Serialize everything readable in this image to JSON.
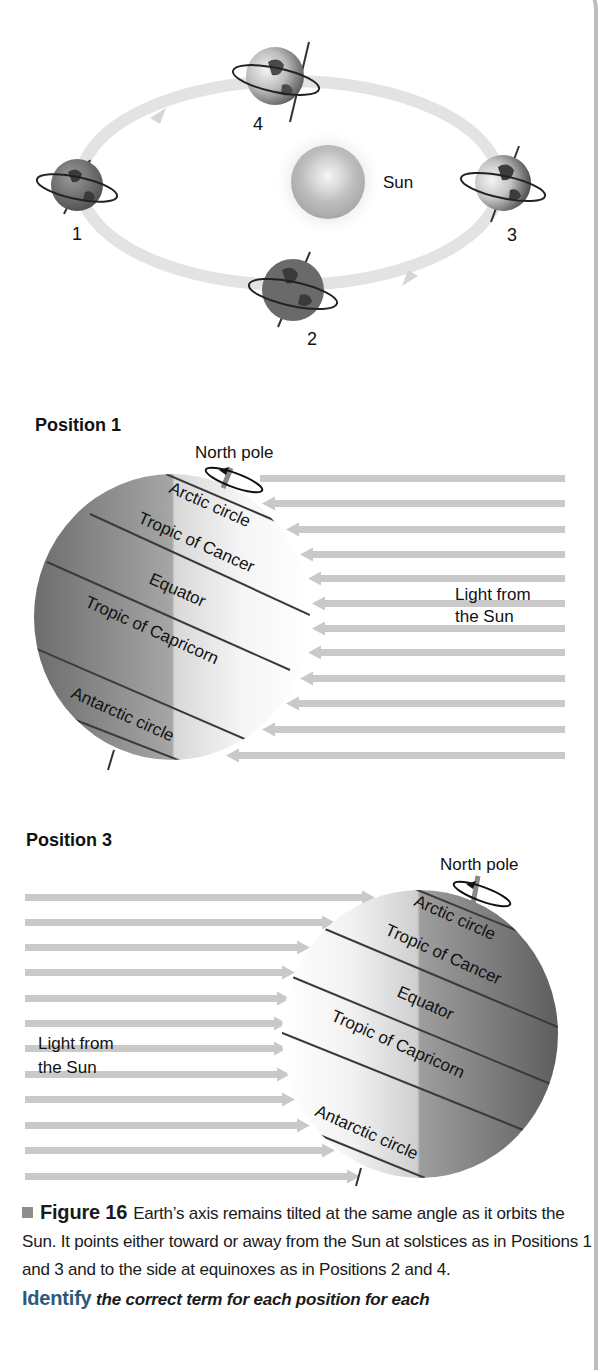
{
  "orbit_diagram": {
    "sun_label": "Sun",
    "positions": [
      {
        "number": "1",
        "cx": 77,
        "cy": 185
      },
      {
        "number": "2",
        "cx": 293,
        "cy": 290
      },
      {
        "number": "3",
        "cx": 503,
        "cy": 183
      },
      {
        "number": "4",
        "cx": 275,
        "cy": 76
      }
    ]
  },
  "position_1": {
    "title": "Position 1",
    "north_pole_label": "North pole",
    "light_label_line1": "Light from",
    "light_label_line2": "the Sun",
    "latitudes": [
      "Arctic circle",
      "Tropic of Cancer",
      "Equator",
      "Tropic of Capricorn",
      "Antarctic circle"
    ],
    "light_direction": "right-to-left",
    "arrow_rows": 12
  },
  "position_3": {
    "title": "Position 3",
    "north_pole_label": "North pole",
    "light_label_line1": "Light from",
    "light_label_line2": "the Sun",
    "latitudes": [
      "Arctic circle",
      "Tropic of Cancer",
      "Equator",
      "Tropic of Capricorn",
      "Antarctic circle"
    ],
    "light_direction": "left-to-right",
    "arrow_rows": 12
  },
  "caption": {
    "figure_label": "Figure 16",
    "text": "Earth’s axis remains tilted at the same angle as it orbits the Sun. It points either toward or away from the Sun at solstices as in Positions 1 and 3 and to the side at equinoxes as in Positions 2 and 4.",
    "identify_label": "Identify",
    "identify_text": "the correct term for each position for each"
  },
  "colors": {
    "orbit": "#e3e3e3",
    "light_arrow": "#c9c9c9",
    "globe_dark": "#6e6e6e",
    "globe_light": "#f4f4f4",
    "latitude_line": "#3a3a3a",
    "bullet": "#8e8e8e",
    "border": "#bdbdbd"
  }
}
